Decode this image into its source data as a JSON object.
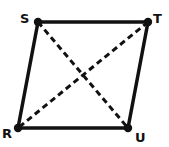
{
  "diagram": {
    "shape": "parallelogram",
    "vertices": [
      {
        "label": "S",
        "x": 38,
        "y": 22,
        "lx": 20,
        "ly": 23
      },
      {
        "label": "T",
        "x": 148,
        "y": 22,
        "lx": 153,
        "ly": 23
      },
      {
        "label": "U",
        "x": 128,
        "y": 128,
        "lx": 135,
        "ly": 142
      },
      {
        "label": "R",
        "x": 18,
        "y": 128,
        "lx": 2,
        "ly": 138
      }
    ],
    "sides": [
      [
        "S",
        "T"
      ],
      [
        "T",
        "U"
      ],
      [
        "U",
        "R"
      ],
      [
        "R",
        "S"
      ]
    ],
    "diagonals": [
      [
        "S",
        "U"
      ],
      [
        "T",
        "R"
      ]
    ],
    "colors": {
      "stroke": "#111111",
      "background": "#ffffff"
    }
  }
}
